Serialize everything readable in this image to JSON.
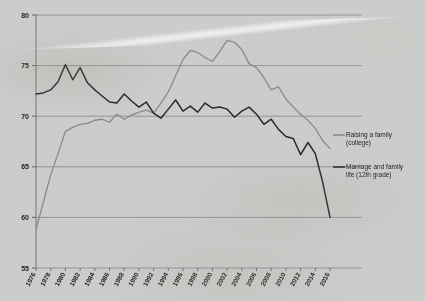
{
  "chart_data": {
    "type": "line",
    "title": "",
    "xlabel": "",
    "ylabel": "",
    "xlim": [
      1976,
      2016
    ],
    "ylim": [
      55,
      80
    ],
    "grid": true,
    "legend_position": "right",
    "y_ticks": [
      "55",
      "60",
      "65",
      "70",
      "75",
      "80"
    ],
    "x_ticks": [
      "1976",
      "1978",
      "1980",
      "1982",
      "1984",
      "1986",
      "1988",
      "1990",
      "1992",
      "1994",
      "1996",
      "1998",
      "2000",
      "2002",
      "2004",
      "2006",
      "2008",
      "2010",
      "2012",
      "2014",
      "2016"
    ],
    "x": [
      1976,
      1977,
      1978,
      1979,
      1980,
      1981,
      1982,
      1983,
      1984,
      1985,
      1986,
      1987,
      1988,
      1989,
      1990,
      1991,
      1992,
      1993,
      1994,
      1995,
      1996,
      1997,
      1998,
      1999,
      2000,
      2001,
      2002,
      2003,
      2004,
      2005,
      2006,
      2007,
      2008,
      2009,
      2010,
      2011,
      2012,
      2013,
      2014,
      2015,
      2016
    ],
    "series": [
      {
        "name": "Raising a family (college)",
        "color": "#8c8c8c",
        "values": [
          58.8,
          61.5,
          64.2,
          66.3,
          68.5,
          68.9,
          69.2,
          69.3,
          69.6,
          69.7,
          69.4,
          70.2,
          69.7,
          70.1,
          70.4,
          70.6,
          70.3,
          71.3,
          72.4,
          74.0,
          75.6,
          76.5,
          76.3,
          75.8,
          75.4,
          76.4,
          77.5,
          77.3,
          76.6,
          75.2,
          74.8,
          73.8,
          72.6,
          72.9,
          71.7,
          70.9,
          70.2,
          69.6,
          68.8,
          67.6,
          66.8
        ]
      },
      {
        "name": "Marriage and family life (12th grade)",
        "color": "#2a2a2a",
        "values": [
          72.2,
          72.3,
          72.6,
          73.4,
          75.1,
          73.6,
          74.8,
          73.3,
          72.6,
          72.0,
          71.4,
          71.3,
          72.2,
          71.5,
          70.9,
          71.4,
          70.3,
          69.8,
          70.7,
          71.6,
          70.5,
          71.0,
          70.4,
          71.3,
          70.8,
          70.9,
          70.7,
          69.9,
          70.5,
          70.9,
          70.2,
          69.2,
          69.7,
          68.7,
          68.0,
          67.8,
          66.2,
          67.4,
          66.3,
          63.5,
          60.0
        ]
      }
    ]
  },
  "legend": {
    "items": [
      {
        "label_line1": "Raising a family",
        "label_line2": "(college)"
      },
      {
        "label_line1": "Marriage and family",
        "label_line2": "life (12th grade)"
      }
    ]
  }
}
